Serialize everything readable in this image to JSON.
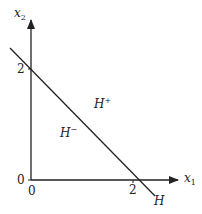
{
  "diagram": {
    "type": "halfspace",
    "axes": {
      "x": {
        "label": "x",
        "subscript": "1",
        "tick": "2",
        "origin": "0"
      },
      "y": {
        "label": "x",
        "subscript": "2",
        "tick": "2",
        "origin": "0"
      }
    },
    "hyperplane": {
      "label": "H"
    },
    "regions": {
      "positive": {
        "label": "H",
        "superscript": "+"
      },
      "negative": {
        "label": "H",
        "superscript": "−"
      }
    },
    "colors": {
      "stroke": "#222222",
      "background": "#ffffff"
    }
  }
}
